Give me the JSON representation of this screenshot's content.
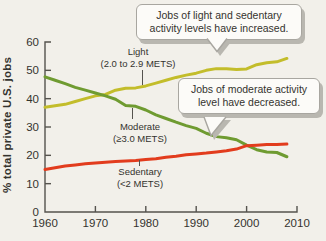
{
  "background_color": "#f2f0ea",
  "axis_color": "#55534e",
  "text_color": "#34332e",
  "callout_style": {
    "bg": "#fcfbf8",
    "border": "#a8a6a0",
    "shadow": "#b9b7b0"
  },
  "callouts": [
    {
      "text": "Jobs of light and sedentary activity levels have increased."
    },
    {
      "text": "Jobs of moderate activity level have decreased."
    }
  ],
  "chart_data": {
    "type": "line",
    "title": "",
    "xlabel": "",
    "ylabel": "% total private U.S. jobs",
    "xlim": [
      1960,
      2010
    ],
    "ylim": [
      0,
      60
    ],
    "x_ticks": [
      1960,
      1970,
      1980,
      1990,
      2000,
      2010
    ],
    "y_ticks": [
      0,
      10,
      20,
      30,
      40,
      50,
      60
    ],
    "grid": false,
    "legend_position": "inline-labels",
    "x": [
      1960,
      1962,
      1964,
      1966,
      1968,
      1970,
      1972,
      1974,
      1976,
      1978,
      1980,
      1982,
      1984,
      1986,
      1988,
      1990,
      1992,
      1994,
      1996,
      1998,
      2000,
      2002,
      2004,
      2006,
      2008
    ],
    "series": [
      {
        "name": "Light",
        "label_note": "(2.0 to 2.9 METS)",
        "color": "#c3bd2b",
        "values": [
          37,
          37.5,
          38,
          39,
          40,
          41,
          41.5,
          43,
          43.7,
          43.8,
          44.5,
          45.5,
          46.5,
          47.5,
          48.3,
          49,
          50,
          50.6,
          50.6,
          50.3,
          50.5,
          52,
          52.7,
          53,
          54.2
        ]
      },
      {
        "name": "Moderate",
        "label_note": "(≥3.0 METS)",
        "color": "#6f9b31",
        "values": [
          47.7,
          46.5,
          45.3,
          44,
          43,
          42,
          41,
          39.8,
          37.6,
          37.3,
          36,
          34.3,
          33,
          31.7,
          30.5,
          29.5,
          27.8,
          26.6,
          26.2,
          25.5,
          23.6,
          22,
          21.2,
          21,
          19.5
        ]
      },
      {
        "name": "Sedentary",
        "label_note": "(<2 METS)",
        "color": "#e23c1d",
        "values": [
          15,
          15.6,
          16.2,
          16.6,
          17,
          17.3,
          17.6,
          17.8,
          18,
          18.2,
          18.5,
          18.8,
          19.3,
          19.7,
          20.2,
          20.5,
          20.8,
          21.2,
          21.6,
          22.2,
          23.4,
          23.6,
          23.8,
          23.8,
          24
        ]
      }
    ]
  }
}
